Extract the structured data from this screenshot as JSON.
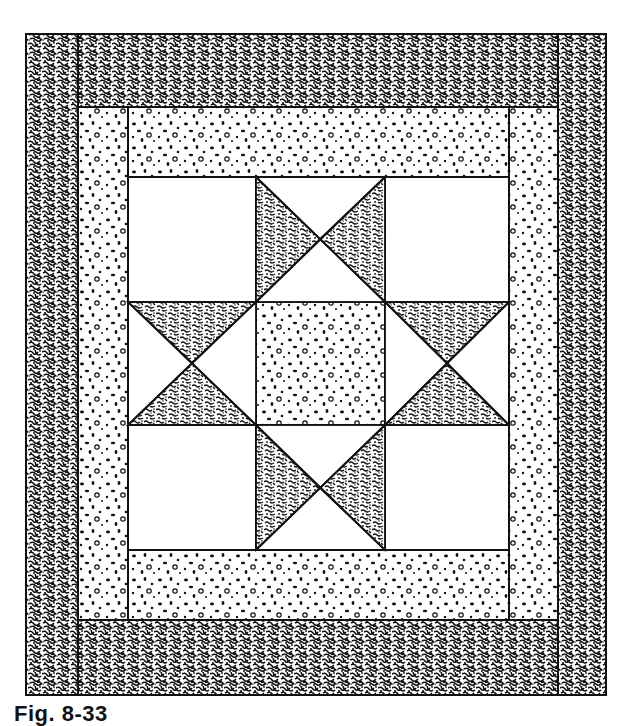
{
  "figure": {
    "caption": "Fig. 8-33",
    "colors": {
      "ink": "#111111",
      "paper": "#ffffff",
      "dark_fabric": "dense black speckle",
      "light_fabric": "white with black dots"
    }
  },
  "layout": {
    "outer_border": {
      "x": 26,
      "y": 34,
      "w": 580,
      "h": 661,
      "fabric": "dark"
    },
    "inner_border": {
      "x": 78,
      "y": 107,
      "w": 480,
      "h": 513,
      "fabric": "light"
    },
    "block": {
      "x": 128,
      "y": 177,
      "w": 381,
      "h": 373
    },
    "grid_x": [
      128,
      256,
      385,
      509
    ],
    "grid_y": [
      177,
      302,
      425,
      550
    ]
  },
  "block_units": [
    {
      "pos": "top-left",
      "type": "plain-square"
    },
    {
      "pos": "top-center",
      "type": "hourglass",
      "dark_sides": [
        "left",
        "right"
      ]
    },
    {
      "pos": "top-right",
      "type": "plain-square"
    },
    {
      "pos": "middle-left",
      "type": "hourglass",
      "dark_sides": [
        "top",
        "bottom"
      ]
    },
    {
      "pos": "center",
      "type": "dotted-square"
    },
    {
      "pos": "middle-right",
      "type": "hourglass",
      "dark_sides": [
        "top",
        "bottom"
      ]
    },
    {
      "pos": "bottom-left",
      "type": "plain-square"
    },
    {
      "pos": "bottom-center",
      "type": "hourglass",
      "dark_sides": [
        "left",
        "right"
      ]
    },
    {
      "pos": "bottom-right",
      "type": "plain-square"
    }
  ]
}
